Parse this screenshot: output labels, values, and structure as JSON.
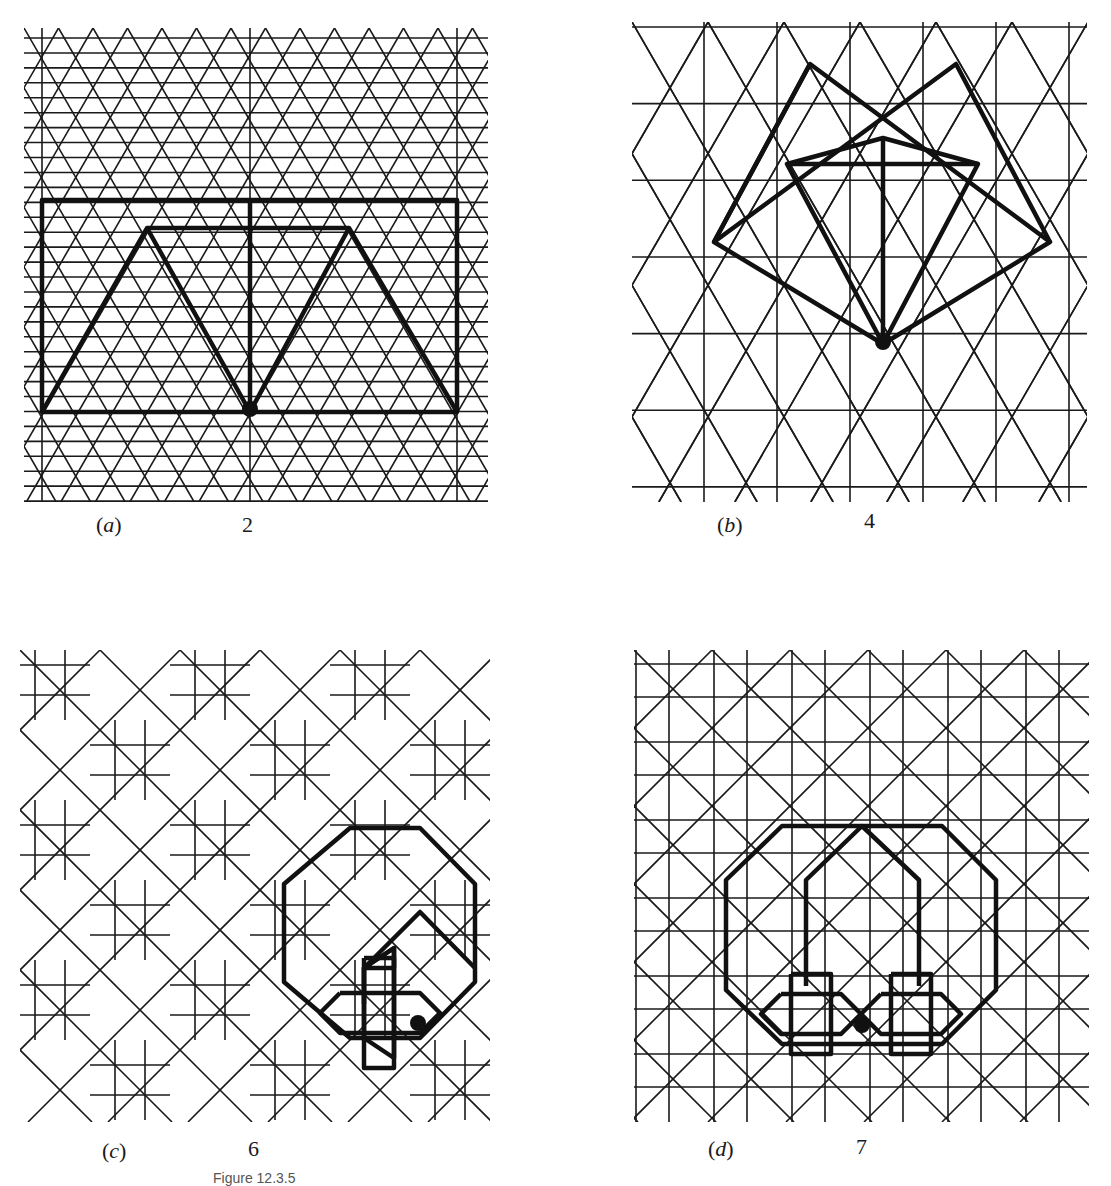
{
  "figure": {
    "title": "Figure 12.3.5",
    "panels": [
      {
        "id": "a",
        "label_open": "(",
        "letter": "a",
        "label_close": ")",
        "number": "2",
        "description": "Triangular lattice with rectangle and zig-zag trapezoid outline, marked point on bottom edge"
      },
      {
        "id": "b",
        "label_open": "(",
        "letter": "b",
        "label_close": ")",
        "number": "4",
        "description": "Square-rotated lattice with overlapping squares/kite outline, marked point at bottom vertex"
      },
      {
        "id": "c",
        "label_open": "(",
        "letter": "c",
        "label_close": ")",
        "number": "6",
        "description": "Diagonal lattice of eight-pointed star motifs with highlighted octagon and star, marked point"
      },
      {
        "id": "d",
        "label_open": "(",
        "letter": "d",
        "label_close": ")",
        "number": "7",
        "description": "Orthogonal grid with diamond motifs, highlighted octagon and two stars, marked point"
      }
    ]
  },
  "colors": {
    "line": "#1a1a1a",
    "background": "#ffffff",
    "caption": "#1a1a1a"
  }
}
